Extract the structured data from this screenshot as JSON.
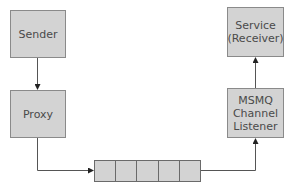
{
  "diagram": {
    "nodes": {
      "sender": "Sender",
      "proxy": "Proxy",
      "service": "Service\n(Receiver)",
      "msmq_listener": "MSMQ\nChannel\nListener"
    },
    "queue": {
      "cell_count": 5
    },
    "edges": [
      {
        "from": "sender",
        "to": "proxy"
      },
      {
        "from": "proxy",
        "to": "queue"
      },
      {
        "from": "queue",
        "to": "msmq_listener"
      },
      {
        "from": "msmq_listener",
        "to": "service"
      }
    ],
    "colors": {
      "box_fill": "#d3d3d3",
      "box_border": "#8a8a8a",
      "line": "#555555",
      "text": "#4a4a4a"
    }
  }
}
